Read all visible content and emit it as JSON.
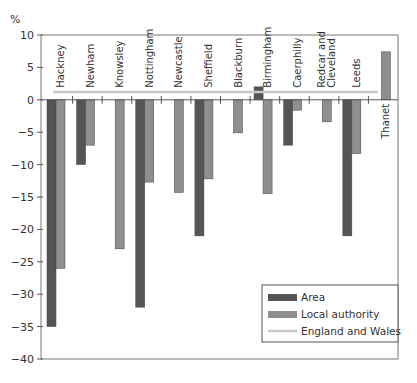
{
  "chart_data": {
    "type": "bar",
    "title": "",
    "ylabel": "%",
    "xlabel": "",
    "ylim": [
      -40,
      10
    ],
    "yticks": [
      10,
      5,
      0,
      -5,
      -10,
      -15,
      -20,
      -25,
      -30,
      -35,
      -40
    ],
    "grid": false,
    "legend_position": "lower right",
    "categories": [
      "Hackney",
      "Newham",
      "Knowsley",
      "Nottingham",
      "Newcastle",
      "Sheffield",
      "Blackburn",
      "Birmingham",
      "Caerphilly",
      "Redcar and Cleveland",
      "Leeds",
      "Thanet"
    ],
    "category_label_lines": [
      [
        "Hackney"
      ],
      [
        "Newham"
      ],
      [
        "Knowsley"
      ],
      [
        "Nottingham"
      ],
      [
        "Newcastle"
      ],
      [
        "Sheffield"
      ],
      [
        "Blackburn"
      ],
      [
        "Birmingham"
      ],
      [
        "Caerphilly"
      ],
      [
        "Redcar and",
        "Cleveland"
      ],
      [
        "Leeds"
      ],
      [
        "Thanet"
      ]
    ],
    "series": [
      {
        "name": "Area",
        "color": "#555555",
        "values": [
          -35,
          -10,
          null,
          -32,
          null,
          -21,
          null,
          2,
          -7,
          null,
          -21,
          null
        ]
      },
      {
        "name": "Local authority",
        "color": "#8f8f8f",
        "values": [
          -26,
          -7,
          -23,
          -12.7,
          -14.3,
          -12.2,
          -5.1,
          -14.5,
          -1.6,
          -3.4,
          -8.3,
          7.4
        ]
      }
    ],
    "reference_line": {
      "name": "England and Wales",
      "value": 1.2,
      "color": "#c8c8c8"
    }
  },
  "legend": {
    "items": [
      {
        "label": "Area"
      },
      {
        "label": "Local authority"
      },
      {
        "label": "England and Wales"
      }
    ]
  },
  "axis": {
    "unit_label": "%"
  }
}
